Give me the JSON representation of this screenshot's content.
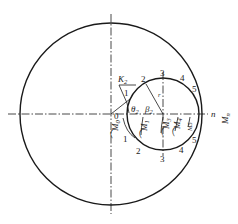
{
  "diagram": {
    "axes": {
      "horizontal_label_n": "n",
      "horizontal_label_M": "M",
      "horizontal_label_M_sub": "n",
      "origin_label": "0"
    },
    "circles": {
      "large": {
        "cx": 111,
        "cy": 114,
        "r": 91
      },
      "small": {
        "cx": 163,
        "cy": 114,
        "r": 36
      }
    },
    "labels": {
      "K": "K",
      "K_sub": "2",
      "theta": "θ",
      "theta_sub": "2",
      "beta": "β",
      "beta_sub": "2",
      "r": "r"
    },
    "upper_points": [
      "1",
      "2",
      "3",
      "4",
      "5"
    ],
    "lower_points": [
      "1",
      "2",
      "3",
      "4",
      "5"
    ],
    "moments": [
      {
        "label": "M",
        "sub": "0"
      },
      {
        "label": "M",
        "sub": "1"
      },
      {
        "label": "M",
        "sub": "3"
      },
      {
        "label": "M",
        "sub": "4"
      },
      {
        "label": "M",
        "sub": "5"
      }
    ],
    "angle_labels": [
      "δ1",
      "δ2",
      "δ3",
      "δ4",
      "δ5"
    ]
  }
}
